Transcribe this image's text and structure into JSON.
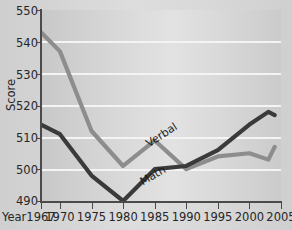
{
  "chart_data": {
    "type": "line",
    "title": "",
    "xlabel": "Year",
    "ylabel": "Score",
    "xlim": [
      1967,
      2005
    ],
    "ylim": [
      490,
      550
    ],
    "ytick_step": 10,
    "grid": true,
    "legend": "inline-labels",
    "x_ticks": [
      "1967",
      "1970",
      "1975",
      "1980",
      "1985",
      "1990",
      "1995",
      "2000",
      "2005"
    ],
    "x_tick_values": [
      1967,
      1970,
      1975,
      1980,
      1985,
      1990,
      1995,
      2000,
      2005
    ],
    "y_ticks": [
      "490",
      "500",
      "510",
      "520",
      "530",
      "540",
      "550"
    ],
    "y_tick_values": [
      490,
      500,
      510,
      520,
      530,
      540,
      550
    ],
    "x": [
      1967,
      1970,
      1975,
      1980,
      1985,
      1990,
      1995,
      2000,
      2003,
      2004
    ],
    "series": [
      {
        "name": "Verbal",
        "color": "#8d8d8d",
        "values": [
          543,
          537,
          512,
          501,
          509,
          500,
          504,
          505,
          503,
          507
        ]
      },
      {
        "name": "Math",
        "color": "#3a3a3a",
        "values": [
          514,
          511,
          498,
          490,
          500,
          501,
          506,
          514,
          518,
          517
        ]
      }
    ],
    "annotations": [
      {
        "text": "Verbal",
        "near_x": 1977,
        "near_y": 508
      },
      {
        "text": "Math",
        "near_x": 1976,
        "near_y": 496
      }
    ]
  },
  "axes": {
    "y_label": "Score",
    "x_label": "Year",
    "y_tick_labels": [
      "550",
      "540",
      "530",
      "520",
      "510",
      "500",
      "490"
    ],
    "x_tick_labels": [
      "1967",
      "1970",
      "1975",
      "1980",
      "1985",
      "1990",
      "1995",
      "2000",
      "2005"
    ]
  },
  "colors": {
    "verbal_line": "#8d8d8d",
    "math_line": "#3a3a3a",
    "gridline": "#f4f4f4",
    "axis": "#4a4a4a",
    "plot_background": "#d6d6d6",
    "page_background": "#d2d2d2"
  },
  "labels": {
    "verbal": "Verbal",
    "math": "Math"
  }
}
